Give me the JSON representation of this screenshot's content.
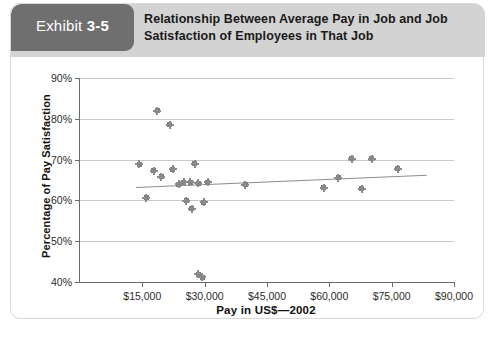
{
  "exhibit": {
    "label": "Exhibit",
    "number": "3-5"
  },
  "header": {
    "title": "Relationship Between Average Pay in Job and Job Satisfaction of Employees in That Job"
  },
  "colors": {
    "tab_background": "#6f6f6f",
    "header_background": "#d3d3d3",
    "marker": "#8a8a8a",
    "gridline": "#c9c9c9",
    "axis": "#6a6a6a",
    "trendline": "#8d8d8d"
  },
  "chart_data": {
    "type": "scatter",
    "title": "Relationship Between Average Pay in Job and Job Satisfaction of Employees in That Job",
    "xlabel": "Pay in US$—2002",
    "ylabel": "Percentage of Pay Satisfaction",
    "xlim": [
      0,
      90000
    ],
    "ylim": [
      40,
      90
    ],
    "xticks": [
      15000,
      30000,
      45000,
      60000,
      75000,
      90000
    ],
    "xticklabels": [
      "$15,000",
      "$30,000",
      "$45,000",
      "$60,000",
      "$75,000",
      "$90,000"
    ],
    "yticks": [
      40,
      50,
      60,
      70,
      80,
      90
    ],
    "yticklabels": [
      "40%",
      "50%",
      "60%",
      "70%",
      "80%",
      "90%"
    ],
    "grid": "horizontal",
    "legend": "none",
    "points": [
      {
        "x": 14200,
        "y": 68.8
      },
      {
        "x": 16000,
        "y": 60.6
      },
      {
        "x": 17800,
        "y": 67.3
      },
      {
        "x": 18600,
        "y": 82.0
      },
      {
        "x": 19600,
        "y": 65.8
      },
      {
        "x": 21600,
        "y": 78.5
      },
      {
        "x": 22300,
        "y": 67.6
      },
      {
        "x": 23800,
        "y": 63.9
      },
      {
        "x": 25000,
        "y": 64.4
      },
      {
        "x": 25600,
        "y": 59.9
      },
      {
        "x": 26500,
        "y": 64.4
      },
      {
        "x": 26900,
        "y": 58.0
      },
      {
        "x": 27600,
        "y": 69.0
      },
      {
        "x": 28400,
        "y": 64.2
      },
      {
        "x": 28500,
        "y": 41.9
      },
      {
        "x": 29400,
        "y": 41.2
      },
      {
        "x": 29800,
        "y": 59.6
      },
      {
        "x": 30700,
        "y": 64.4
      },
      {
        "x": 39800,
        "y": 63.8
      },
      {
        "x": 58600,
        "y": 63.1
      },
      {
        "x": 62100,
        "y": 65.6
      },
      {
        "x": 65400,
        "y": 70.2
      },
      {
        "x": 67800,
        "y": 62.9
      },
      {
        "x": 70200,
        "y": 70.2
      },
      {
        "x": 76500,
        "y": 67.7
      }
    ],
    "trendline": {
      "x_start": 13500,
      "y_start": 63.4,
      "x_end": 83500,
      "y_end": 66.4
    },
    "annotations": []
  }
}
